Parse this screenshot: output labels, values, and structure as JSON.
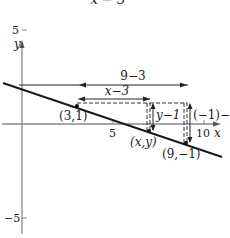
{
  "title": "x − 3",
  "axes": {
    "x_label": "x",
    "y_label": "y",
    "x_ticks": [
      {
        "value": 5,
        "label": "5"
      },
      {
        "value": 10,
        "label": "10"
      }
    ],
    "y_ticks": [
      {
        "value": 5,
        "label": "5"
      },
      {
        "value": -5,
        "label": "−5"
      }
    ]
  },
  "points": [
    {
      "label": "(3,1)",
      "x": 3,
      "y": 1
    },
    {
      "label": "(x,y)",
      "x": 7,
      "y": -0.33
    },
    {
      "label": "(9,−1)",
      "x": 9,
      "y": -1
    }
  ],
  "annotations": {
    "run_full": "9−3",
    "run_partial": "x−3",
    "rise_partial": "y−1",
    "rise_full": "(−1)−1"
  },
  "colors": {
    "line": "#1a1a1a",
    "axis": "#888888",
    "text": "#222222"
  }
}
